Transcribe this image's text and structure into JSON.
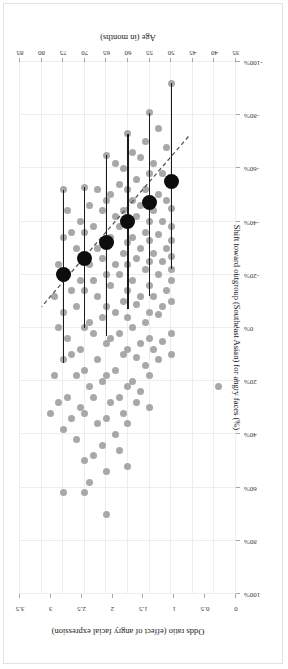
{
  "chart_data": {
    "type": "scatter",
    "title": "",
    "orientation": "figure rendered rotated 180 degrees",
    "xlabel": "Age (in months)",
    "ylabel": "Shift toward outgroup (Southeast Asian) for angry faces (%)",
    "y2label": "Odds ratio (effect of angry facial expression)",
    "xlim": [
      35,
      85
    ],
    "ylim": [
      -100,
      100
    ],
    "y2lim": [
      0,
      3.5
    ],
    "xticks": [
      35,
      40,
      45,
      50,
      55,
      60,
      65,
      70,
      75,
      80,
      85
    ],
    "xticklabels": [
      "35",
      "40",
      "45",
      "50",
      "55",
      "60",
      "65",
      "70",
      "75",
      "80",
      "85"
    ],
    "yticks": [
      -100,
      -80,
      -60,
      -40,
      -20,
      0,
      20,
      40,
      60,
      80,
      100
    ],
    "yticklabels": [
      "-100%",
      "-80%",
      "-60%",
      "-40%",
      "-20%",
      "0%",
      "20%",
      "40%",
      "60%",
      "80%",
      "100%"
    ],
    "y2ticks": [
      0,
      0.5,
      1,
      1.5,
      2,
      2.5,
      3,
      3.5
    ],
    "y2ticklabels": [
      "0",
      "0.5",
      "1",
      "1.5",
      "2",
      "2.5",
      "3",
      "3.5"
    ],
    "grid": true,
    "legend": "none",
    "colors": {
      "individual_points": "#a8a8a8",
      "binned_means": "#0d0d0d",
      "error_bars": "#1a1a1a",
      "fit_line": "#595959",
      "grid": "#ededed",
      "axis": "#a6a6a6"
    },
    "series": [
      {
        "name": "Binned means (with error bars)",
        "marker": "large filled circle",
        "x": [
          50,
          55,
          60,
          65,
          70,
          75
        ],
        "y": [
          -55,
          -47,
          -40,
          -32,
          -26,
          -20
        ],
        "yerr_low": [
          -92,
          -81,
          -73,
          -65,
          -53,
          -52
        ],
        "yerr_high": [
          -22,
          -12,
          -7,
          3,
          0,
          13
        ]
      },
      {
        "name": "Regression fit (dashed)",
        "style": "dashed line",
        "x": [
          46,
          80
        ],
        "y": [
          -72,
          -8
        ]
      },
      {
        "name": "Individual participants",
        "marker": "small grey circle",
        "points": [
          [
            39,
            22
          ],
          [
            50,
            -92
          ],
          [
            50,
            -55
          ],
          [
            50,
            -45
          ],
          [
            50,
            -38
          ],
          [
            50,
            -33
          ],
          [
            50,
            -27
          ],
          [
            50,
            -22
          ],
          [
            50,
            -18
          ],
          [
            50,
            -10
          ],
          [
            50,
            2
          ],
          [
            50,
            10
          ],
          [
            51,
            -68
          ],
          [
            51,
            -48
          ],
          [
            51,
            -30
          ],
          [
            51,
            -14
          ],
          [
            52,
            -58
          ],
          [
            52,
            -40
          ],
          [
            52,
            -25
          ],
          [
            52,
            -8
          ],
          [
            52,
            5
          ],
          [
            53,
            -75
          ],
          [
            53,
            -50
          ],
          [
            53,
            -35
          ],
          [
            53,
            -20
          ],
          [
            53,
            -5
          ],
          [
            53,
            12
          ],
          [
            54,
            -62
          ],
          [
            54,
            -44
          ],
          [
            54,
            -28
          ],
          [
            54,
            -12
          ],
          [
            54,
            8
          ],
          [
            55,
            -81
          ],
          [
            55,
            -58
          ],
          [
            55,
            -47
          ],
          [
            55,
            -40
          ],
          [
            55,
            -33
          ],
          [
            55,
            -25
          ],
          [
            55,
            -16
          ],
          [
            55,
            -6
          ],
          [
            55,
            4
          ],
          [
            55,
            18
          ],
          [
            55,
            30
          ],
          [
            56,
            -70
          ],
          [
            56,
            -52
          ],
          [
            56,
            -36
          ],
          [
            56,
            -22
          ],
          [
            56,
            -2
          ],
          [
            56,
            14
          ],
          [
            57,
            -64
          ],
          [
            57,
            -46
          ],
          [
            57,
            -30
          ],
          [
            57,
            -12
          ],
          [
            57,
            6
          ],
          [
            57,
            24
          ],
          [
            58,
            -56
          ],
          [
            58,
            -42
          ],
          [
            58,
            -26
          ],
          [
            58,
            -9
          ],
          [
            58,
            11
          ],
          [
            58,
            28
          ],
          [
            59,
            -66
          ],
          [
            59,
            -48
          ],
          [
            59,
            -34
          ],
          [
            59,
            -18
          ],
          [
            59,
            0
          ],
          [
            59,
            20
          ],
          [
            60,
            -73
          ],
          [
            60,
            -52
          ],
          [
            60,
            -40
          ],
          [
            60,
            -32
          ],
          [
            60,
            -24
          ],
          [
            60,
            -14
          ],
          [
            60,
            -4
          ],
          [
            60,
            8
          ],
          [
            60,
            22
          ],
          [
            60,
            36
          ],
          [
            60,
            52
          ],
          [
            61,
            -60
          ],
          [
            61,
            -44
          ],
          [
            61,
            -28
          ],
          [
            61,
            -10
          ],
          [
            61,
            10
          ],
          [
            61,
            32
          ],
          [
            62,
            -54
          ],
          [
            62,
            -38
          ],
          [
            62,
            -20
          ],
          [
            62,
            2
          ],
          [
            62,
            26
          ],
          [
            62,
            46
          ],
          [
            63,
            -62
          ],
          [
            63,
            -42
          ],
          [
            63,
            -24
          ],
          [
            63,
            -6
          ],
          [
            63,
            16
          ],
          [
            63,
            40
          ],
          [
            64,
            -50
          ],
          [
            64,
            -34
          ],
          [
            64,
            -16
          ],
          [
            64,
            4
          ],
          [
            64,
            28
          ],
          [
            65,
            -65
          ],
          [
            65,
            -48
          ],
          [
            65,
            -32
          ],
          [
            65,
            -20
          ],
          [
            65,
            -8
          ],
          [
            65,
            6
          ],
          [
            65,
            18
          ],
          [
            65,
            34
          ],
          [
            65,
            54
          ],
          [
            65,
            70
          ],
          [
            66,
            -44
          ],
          [
            66,
            -26
          ],
          [
            66,
            -4
          ],
          [
            66,
            20
          ],
          [
            66,
            44
          ],
          [
            67,
            -52
          ],
          [
            67,
            -30
          ],
          [
            67,
            -12
          ],
          [
            67,
            12
          ],
          [
            67,
            36
          ],
          [
            68,
            -38
          ],
          [
            68,
            -18
          ],
          [
            68,
            2
          ],
          [
            68,
            26
          ],
          [
            68,
            48
          ],
          [
            69,
            -46
          ],
          [
            69,
            -24
          ],
          [
            69,
            -2
          ],
          [
            69,
            22
          ],
          [
            69,
            58
          ],
          [
            70,
            -53
          ],
          [
            70,
            -36
          ],
          [
            70,
            -26
          ],
          [
            70,
            -14
          ],
          [
            70,
            0
          ],
          [
            70,
            16
          ],
          [
            70,
            32
          ],
          [
            70,
            50
          ],
          [
            70,
            62
          ],
          [
            71,
            -40
          ],
          [
            71,
            -18
          ],
          [
            71,
            8
          ],
          [
            71,
            30
          ],
          [
            72,
            -30
          ],
          [
            72,
            -8
          ],
          [
            72,
            18
          ],
          [
            72,
            42
          ],
          [
            73,
            -36
          ],
          [
            73,
            -14
          ],
          [
            73,
            10
          ],
          [
            73,
            34
          ],
          [
            74,
            -44
          ],
          [
            74,
            -20
          ],
          [
            74,
            4
          ],
          [
            74,
            26
          ],
          [
            75,
            -52
          ],
          [
            75,
            -34
          ],
          [
            75,
            -20
          ],
          [
            75,
            -6
          ],
          [
            75,
            12
          ],
          [
            75,
            38
          ],
          [
            75,
            62
          ],
          [
            76,
            -24
          ],
          [
            76,
            0
          ],
          [
            76,
            28
          ],
          [
            77,
            -12
          ],
          [
            77,
            18
          ],
          [
            78,
            32
          ]
        ]
      }
    ],
    "annotations": []
  }
}
